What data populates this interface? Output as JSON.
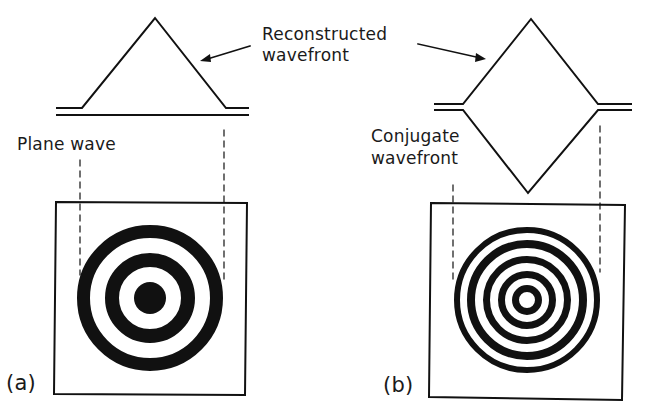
{
  "figure": {
    "panels": [
      {
        "id": "a",
        "label": "(a)",
        "wavefront_label": "Plane wave",
        "rings": "3 concentric dark rings with solid center disc, wide spacing"
      },
      {
        "id": "b",
        "label": "(b)",
        "wavefront_label": "Conjugate wavefront",
        "rings": "5 concentric dark rings with open center, narrow spacing"
      }
    ],
    "shared_annotation": "Reconstructed wavefront",
    "labels": {
      "reconstructed_line1": "Reconstructed",
      "reconstructed_line2": "wavefront",
      "plane_wave": "Plane wave",
      "conjugate_line1": "Conjugate",
      "conjugate_line2": "wavefront",
      "panel_a": "(a)",
      "panel_b": "(b)"
    },
    "colors": {
      "ink": "#111111",
      "background": "#ffffff"
    }
  }
}
